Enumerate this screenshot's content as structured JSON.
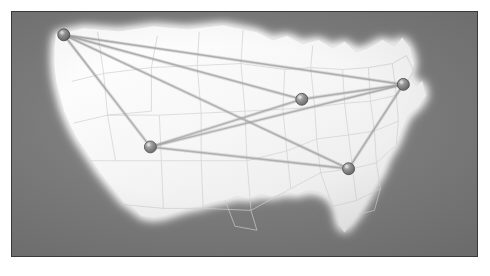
{
  "panel": {
    "name": "us-network-map",
    "background_color": "#787878",
    "border_color": "#3a3a3a",
    "landmass_color": "#f4f4f4",
    "glow_color": "#ffffff",
    "state_border_color": "#c9c9c9",
    "link_color": "#9a9a9a",
    "node_color": "#7a7a7a",
    "node_highlight_color": "#bdbdbd",
    "node_outline_color": "#4a4a4a"
  },
  "map_data": {
    "type": "node-link-map",
    "projection_region": "continental-united-states",
    "node_count": 5,
    "link_count": 9,
    "nodes": [
      {
        "id": "n1",
        "label": "",
        "region": "pacific-northwest",
        "x": 64,
        "y": 35,
        "radius": 6
      },
      {
        "id": "n2",
        "label": "",
        "region": "southwest",
        "x": 151,
        "y": 148,
        "radius": 6
      },
      {
        "id": "n3",
        "label": "",
        "region": "midwest",
        "x": 303,
        "y": 100,
        "radius": 6
      },
      {
        "id": "n4",
        "label": "",
        "region": "northeast",
        "x": 405,
        "y": 85,
        "radius": 6
      },
      {
        "id": "n5",
        "label": "",
        "region": "southeast",
        "x": 350,
        "y": 170,
        "radius": 6
      }
    ],
    "links": [
      {
        "from": "n1",
        "to": "n2",
        "weight": 1
      },
      {
        "from": "n1",
        "to": "n3",
        "weight": 1
      },
      {
        "from": "n1",
        "to": "n4",
        "weight": 1
      },
      {
        "from": "n1",
        "to": "n5",
        "weight": 1
      },
      {
        "from": "n2",
        "to": "n3",
        "weight": 1
      },
      {
        "from": "n2",
        "to": "n4",
        "weight": 1
      },
      {
        "from": "n2",
        "to": "n5",
        "weight": 1
      },
      {
        "from": "n3",
        "to": "n4",
        "weight": 1
      },
      {
        "from": "n4",
        "to": "n5",
        "weight": 1
      }
    ]
  },
  "text": {
    "caption": ""
  }
}
